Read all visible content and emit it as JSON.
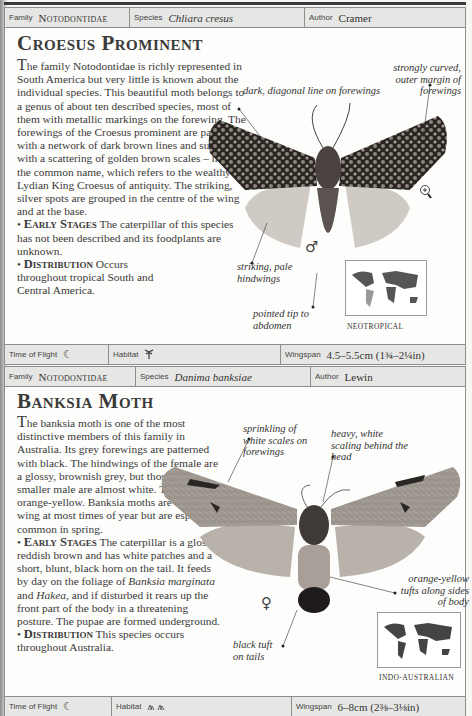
{
  "entries": [
    {
      "family_label": "Family",
      "family": "Notodontidae",
      "species_label": "Species",
      "species": "Chliara cresus",
      "author_label": "Author",
      "author": "Cramer",
      "title": "Croesus Prominent",
      "intro_dropcap": "T",
      "intro": "he family Notodontidae is richly represented in South America but very little is known about the individual species. This beautiful moth belongs to a genus of about ten described species, most of them with metallic markings on the forewing. The forewings of the Croesus prominent are patterned with a network of dark brown lines and suffused with a scattering of golden brown scales – hence the common name, which refers to the wealthy Lydian King Croesus of antiquity. The striking, silver spots are grouped in the centre of the wing and at the base.",
      "early_stages_heading": "Early Stages",
      "early_stages": "The caterpillar of this species has not been described and its foodplants are unknown.",
      "distribution_heading": "Distribution",
      "distribution": "Occurs throughout tropical South and Central America.",
      "annotations": [
        "dark, diagonal line on forewings",
        "strongly curved, outer margin of forewings",
        "striking, pale hindwings",
        "pointed tip to abdomen"
      ],
      "sex_symbol": "♂",
      "sex": "male",
      "region": "Neotropical",
      "time_of_flight_label": "Time of Flight",
      "time_of_flight_icon": "crescent-moon-icon",
      "habitat_label": "Habitat",
      "habitat_icon": "palm-tree-icon",
      "wingspan_label": "Wingspan",
      "wingspan": "4.5–5.5cm (1¾–2¼in)",
      "colors": {
        "wing_dark": "#2b2522",
        "wing_mottle": "#8b847c",
        "hindwing": "#cfcac4",
        "body": "#4a4340"
      }
    },
    {
      "family_label": "Family",
      "family": "Notodontidae",
      "species_label": "Species",
      "species": "Danima banksiae",
      "author_label": "Author",
      "author": "Lewin",
      "title": "Banksia Moth",
      "intro_dropcap": "T",
      "intro": "he banksia moth is one of the most distinctive members of this family in Australia. Its grey forewings are patterned with black. The hindwings of the female are a glossy, brownish grey, but those of the smaller male are almost white. The body is orange-yellow. Banksia moths are on the wing at most times of year but are especially common in spring.",
      "early_stages_heading": "Early Stages",
      "early_stages_pre": "The caterpillar is a glossy, reddish brown and has white patches and a short, blunt, black horn on the tail. It feeds by day on the foliage of ",
      "early_stages_plant1": "Banksia marginata",
      "early_stages_mid": " and ",
      "early_stages_plant2": "Hakea",
      "early_stages_post": ", and if disturbed it rears up the front part of the body in a threatening posture. The pupae are formed underground.",
      "distribution_heading": "Distribution",
      "distribution": "This species occurs throughout Australia.",
      "annotations": [
        "sprinkling of white scales on forewings",
        "heavy, white scaling behind the head",
        "orange-yellow tufts along sides of body",
        "black tuft on tails"
      ],
      "sex_symbol": "♀",
      "sex": "female",
      "region": "Indo-Australian",
      "time_of_flight_label": "Time of Flight",
      "time_of_flight_icon": "crescent-moon-icon",
      "habitat_label": "Habitat",
      "habitat_icon": "shrubland-icon",
      "wingspan_label": "Wingspan",
      "wingspan": "6–8cm (2⅜–3⅛in)",
      "colors": {
        "wing_grey": "#9a948c",
        "wing_black": "#2a2624",
        "hindwing": "#b8b2aa",
        "body": "#a8a098",
        "tail": "#1e1b1a"
      }
    }
  ]
}
